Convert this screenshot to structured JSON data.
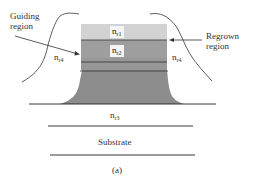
{
  "figure": {
    "caption": "(a)",
    "labels": {
      "guiding_region_line1": "Guiding",
      "guiding_region_line2": "region",
      "regrown_region_line1": "Regrown",
      "regrown_region_line2": "region",
      "substrate": "Substrate"
    },
    "indices": {
      "nr1": {
        "base": "n",
        "sub": "r1"
      },
      "nr2": {
        "base": "n",
        "sub": "r2"
      },
      "nr3": {
        "base": "n",
        "sub": "r3"
      },
      "nr4_left": {
        "base": "n",
        "sub": "r4"
      },
      "nr4_right": {
        "base": "n",
        "sub": "r4"
      }
    },
    "colors": {
      "layer_top": "#cfcfcf",
      "layer_mid": "#9a9a9a",
      "layer_base": "#8c8c8c",
      "lines": "#222222"
    }
  }
}
